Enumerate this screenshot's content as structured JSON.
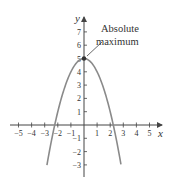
{
  "chart_data": {
    "type": "line",
    "title": "",
    "function": "y = 5 - x^2",
    "xlabel": "x",
    "ylabel": "y",
    "xlim": [
      -5.5,
      6
    ],
    "ylim": [
      -3.8,
      8
    ],
    "grid": false,
    "x_ticks": [
      -5,
      -4,
      -3,
      -2,
      -1,
      1,
      2,
      3,
      4,
      5
    ],
    "y_ticks": [
      -3,
      -2,
      -1,
      1,
      2,
      3,
      4,
      5,
      6,
      7
    ],
    "x_tick_labels": [
      "−5",
      "−4",
      "−3",
      "−2",
      "−1",
      "1",
      "2",
      "3",
      "4",
      "5"
    ],
    "y_tick_labels": [
      "−3",
      "−2",
      "−1",
      "1",
      "2",
      "3",
      "4",
      "5",
      "6",
      "7"
    ],
    "series": [
      {
        "name": "parabola",
        "x": [
          -2.83,
          -2.5,
          -2,
          -1.5,
          -1,
          -0.5,
          0,
          0.5,
          1,
          1.5,
          2,
          2.5,
          2.83
        ],
        "y": [
          -3,
          -1.25,
          1,
          2.75,
          4,
          4.75,
          5,
          4.75,
          4,
          2.75,
          1,
          -1.25,
          -3
        ]
      }
    ],
    "annotations": [
      {
        "text_line1": "Absolute",
        "text_line2": "maximum",
        "point": [
          0,
          5
        ]
      }
    ],
    "colors": {
      "curve": "#8a8a8a",
      "axis": "#444444",
      "point": "#333333"
    }
  }
}
